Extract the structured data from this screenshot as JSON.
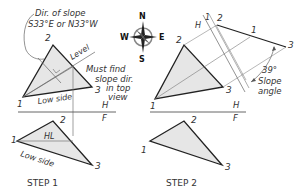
{
  "step1": {
    "title": "STEP 1",
    "note_direction_line1": "Dir. of slope",
    "note_direction_line2": "S33°E or N33°W",
    "note_must_line1": "Must find",
    "note_must_line2": "slope dir.",
    "note_must_line3": "in top",
    "note_must_line4": "view",
    "label_level": "Level",
    "label_low_side_top": "Low side",
    "label_low_side_bottom": "Low side",
    "label_hl": "HL",
    "fold_h": "H",
    "fold_f": "F",
    "top_points": {
      "p1": "1",
      "p2": "2",
      "p3": "3"
    },
    "front_points": {
      "p1": "1",
      "p2": "2",
      "p3": "3"
    }
  },
  "step2": {
    "title": "STEP 2",
    "fold_h": "H",
    "fold_f": "F",
    "aux_fold_h": "H",
    "aux_fold_1": "1",
    "slope_angle_value": "39°",
    "slope_angle_label_line1": "Slope",
    "slope_angle_label_line2": "angle",
    "top_points": {
      "p1": "1",
      "p2": "2",
      "p3": "3"
    },
    "edge_points": {
      "p1": "1",
      "p2": "2",
      "p3": "3"
    },
    "front_points": {
      "p1": "1",
      "p2": "2",
      "p3": "3"
    }
  },
  "compass": {
    "n": "N",
    "s": "S",
    "e": "E",
    "w": "W"
  },
  "colors": {
    "line": "#222222",
    "thin": "#777777",
    "fill": "#e6e6e6",
    "text": "#333333"
  }
}
